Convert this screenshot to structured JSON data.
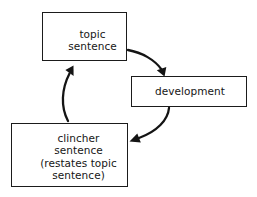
{
  "diagram": {
    "type": "cycle-flowchart",
    "background_color": "#ffffff",
    "line_color": "#141414",
    "text_color": "#161616",
    "nodes": [
      {
        "id": "topic",
        "label": "topic\nsentence",
        "shape": "rectangle"
      },
      {
        "id": "development",
        "label": "development",
        "shape": "rectangle"
      },
      {
        "id": "clincher",
        "label": "clincher\nsentence\n(restates topic\nsentence)",
        "shape": "rectangle"
      }
    ],
    "edges": [
      {
        "id": "topic-to-development",
        "from": "topic",
        "to": "development",
        "style": "curved-arrow",
        "label": ""
      },
      {
        "id": "development-to-clincher",
        "from": "development",
        "to": "clincher",
        "style": "curved-arrow",
        "label": ""
      },
      {
        "id": "clincher-to-topic",
        "from": "clincher",
        "to": "topic",
        "style": "curved-arrow",
        "label": ""
      }
    ]
  }
}
